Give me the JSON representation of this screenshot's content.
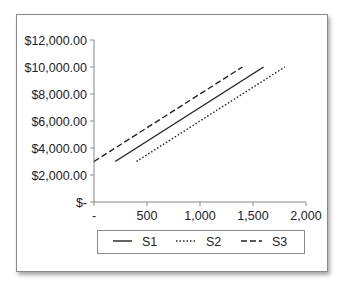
{
  "chart_data": {
    "type": "line",
    "title": "",
    "xlabel": "",
    "ylabel": "",
    "xlim": [
      0,
      2000
    ],
    "ylim": [
      0,
      12000
    ],
    "x_ticks": [
      0,
      500,
      1000,
      1500,
      2000
    ],
    "x_tick_labels": [
      "-",
      "500",
      "1,000",
      "1,500",
      "2,000"
    ],
    "y_ticks": [
      0,
      2000,
      4000,
      6000,
      8000,
      10000,
      12000
    ],
    "y_tick_labels": [
      "$-",
      "$2,000.00",
      "$4,000.00",
      "$6,000.00",
      "$8,000.00",
      "$10,000.00",
      "$12,000.00"
    ],
    "grid": false,
    "legend_position": "bottom",
    "series": [
      {
        "name": "S1",
        "style": "solid",
        "x": [
          200,
          1600
        ],
        "y": [
          3000,
          10000
        ]
      },
      {
        "name": "S2",
        "style": "dotted",
        "x": [
          400,
          1800
        ],
        "y": [
          3000,
          10000
        ]
      },
      {
        "name": "S3",
        "style": "dashed",
        "x": [
          0,
          1400
        ],
        "y": [
          3000,
          10000
        ]
      }
    ]
  },
  "legend": {
    "items": [
      {
        "label": "S1"
      },
      {
        "label": "S2"
      },
      {
        "label": "S3"
      }
    ]
  }
}
